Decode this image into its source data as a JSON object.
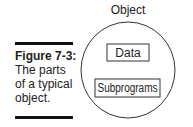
{
  "figure": {
    "label": "Figure 7-3:",
    "caption": "The parts of a typical object."
  },
  "diagram": {
    "title": "Object",
    "components": [
      "Data",
      "Subprograms"
    ]
  }
}
